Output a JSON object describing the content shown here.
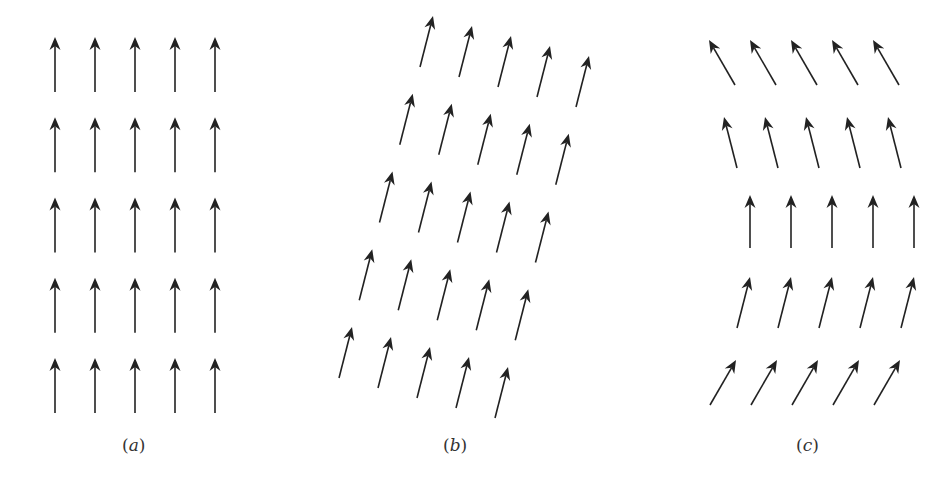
{
  "figure": {
    "arrow_color": "#222222",
    "panels": [
      {
        "id": "a",
        "label": "(a)",
        "label_pos": [
          134,
          447
        ],
        "description": "Uniform field: all arrows point straight up",
        "rows": 5,
        "cols": 5,
        "origin_tail": [
          55,
          413
        ],
        "col_step": [
          40,
          0
        ],
        "row_step": [
          0,
          -80.25
        ],
        "vector": [
          0,
          -55
        ]
      },
      {
        "id": "b",
        "label": "(b)",
        "label_pos": [
          455,
          447
        ],
        "description": "Uniform field on sheared lattice: arrows tilted right",
        "rows": 5,
        "cols": 5,
        "origin_tail": [
          339,
          378
        ],
        "col_step": [
          39,
          10
        ],
        "row_step": [
          20.25,
          -77.75
        ],
        "vector": [
          13,
          -51
        ]
      },
      {
        "id": "c",
        "label": "(c)",
        "label_pos": [
          808,
          447
        ],
        "description": "Rotating field: arrows turn from tilted-right (bottom) to tilted-left (top)",
        "rows": 5,
        "cols": 5,
        "col_step": [
          41,
          0
        ],
        "row_tails": [
          [
            710,
            405
          ],
          [
            737,
            328
          ],
          [
            750,
            248
          ],
          [
            737,
            168
          ],
          [
            735,
            85
          ]
        ],
        "row_vectors": [
          [
            26,
            -45
          ],
          [
            13,
            -51
          ],
          [
            0,
            -53
          ],
          [
            -13,
            -51
          ],
          [
            -26,
            -45
          ]
        ]
      }
    ]
  }
}
